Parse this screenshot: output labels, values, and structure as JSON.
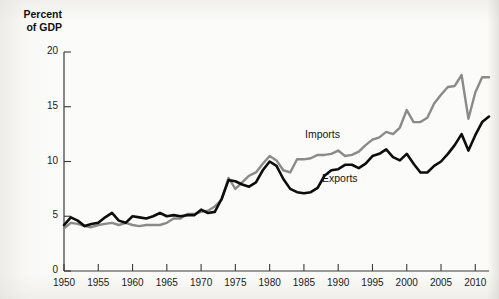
{
  "figure": {
    "background_color": "#fbfbf9",
    "y_axis_title": "Percent\nof GDP",
    "imports_color": "#8a8a8a",
    "exports_color": "#0d0d0d",
    "axis_color": "#3a3a3a"
  },
  "labels": {
    "imports": "Imports",
    "exports": "Exports"
  },
  "chart_data": {
    "type": "line",
    "title": "",
    "subtitle": "",
    "xlabel": "",
    "ylabel": "Percent of GDP",
    "xlim": [
      1950,
      2012
    ],
    "ylim": [
      0,
      20
    ],
    "yticks": [
      0,
      5,
      10,
      15,
      20
    ],
    "xticks": [
      1950,
      1955,
      1960,
      1965,
      1970,
      1975,
      1980,
      1985,
      1990,
      1995,
      2000,
      2005,
      2010
    ],
    "grid": false,
    "legend": "inline-annotation",
    "x": [
      1950,
      1951,
      1952,
      1953,
      1954,
      1955,
      1956,
      1957,
      1958,
      1959,
      1960,
      1961,
      1962,
      1963,
      1964,
      1965,
      1966,
      1967,
      1968,
      1969,
      1970,
      1971,
      1972,
      1973,
      1974,
      1975,
      1976,
      1977,
      1978,
      1979,
      1980,
      1981,
      1982,
      1983,
      1984,
      1985,
      1986,
      1987,
      1988,
      1989,
      1990,
      1991,
      1992,
      1993,
      1994,
      1995,
      1996,
      1997,
      1998,
      1999,
      2000,
      2001,
      2002,
      2003,
      2004,
      2005,
      2006,
      2007,
      2008,
      2009,
      2010,
      2011,
      2012
    ],
    "series": [
      {
        "name": "Exports",
        "color": "#0d0d0d",
        "values": [
          4.2,
          4.9,
          4.6,
          4.1,
          4.3,
          4.4,
          4.9,
          5.3,
          4.6,
          4.4,
          5.0,
          4.9,
          4.8,
          5.0,
          5.3,
          5.0,
          5.1,
          5.0,
          5.1,
          5.1,
          5.6,
          5.3,
          5.4,
          6.6,
          8.3,
          8.2,
          7.9,
          7.7,
          8.1,
          9.2,
          10.0,
          9.6,
          8.4,
          7.5,
          7.2,
          7.1,
          7.2,
          7.6,
          8.7,
          9.2,
          9.3,
          9.7,
          9.7,
          9.4,
          9.8,
          10.5,
          10.7,
          11.1,
          10.4,
          10.1,
          10.7,
          9.8,
          9.0,
          9.0,
          9.6,
          10.0,
          10.7,
          11.5,
          12.5,
          11.0,
          12.4,
          13.6,
          14.1
        ]
      },
      {
        "name": "Imports",
        "color": "#8a8a8a",
        "values": [
          3.9,
          4.4,
          4.3,
          4.1,
          4.0,
          4.2,
          4.3,
          4.4,
          4.2,
          4.4,
          4.2,
          4.1,
          4.2,
          4.2,
          4.2,
          4.4,
          4.8,
          4.8,
          5.2,
          5.2,
          5.4,
          5.5,
          5.9,
          6.5,
          8.5,
          7.5,
          8.1,
          8.7,
          9.0,
          9.8,
          10.5,
          10.1,
          9.2,
          9.0,
          10.2,
          10.2,
          10.3,
          10.6,
          10.6,
          10.7,
          11.0,
          10.5,
          10.6,
          10.9,
          11.5,
          12.0,
          12.2,
          12.7,
          12.5,
          13.1,
          14.7,
          13.6,
          13.6,
          14.0,
          15.3,
          16.1,
          16.8,
          16.9,
          17.9,
          13.9,
          16.3,
          17.7,
          17.7
        ]
      }
    ]
  }
}
